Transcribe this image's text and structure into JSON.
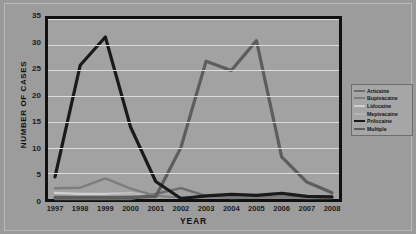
{
  "chart_data": {
    "type": "line",
    "title": "",
    "xlabel": "YEAR",
    "ylabel": "NUMBER OF CASES",
    "categories": [
      "1997",
      "1998",
      "1999",
      "2000",
      "2001",
      "2002",
      "2003",
      "2004",
      "2005",
      "2006",
      "2007",
      "2008"
    ],
    "ylim": [
      0,
      35
    ],
    "yticks": [
      0,
      5,
      10,
      15,
      20,
      25,
      30,
      35
    ],
    "grid": true,
    "legend_position": "right",
    "series": [
      {
        "name": "Articaine",
        "color": "#6b6b6b",
        "values": [
          0,
          0,
          0,
          0,
          1.0,
          2.1,
          0.6,
          0.2,
          0.3,
          0.4,
          0.3,
          0.5
        ]
      },
      {
        "name": "Bupivacaine",
        "color": "#7d7d7d",
        "values": [
          2.1,
          2.2,
          4.0,
          2.0,
          0.6,
          0.3,
          0.3,
          0.3,
          0.3,
          0.3,
          0.2,
          0.2
        ]
      },
      {
        "name": "Lidocaine",
        "color": "#cfcfcf",
        "values": [
          1.2,
          1.0,
          1.0,
          1.1,
          0.6,
          0.3,
          0.3,
          0.3,
          0.4,
          0.3,
          0.3,
          0.3
        ]
      },
      {
        "name": "Mepivacaine",
        "color": "#b4b4b4",
        "values": [
          0.4,
          0.5,
          0.6,
          1.0,
          0.5,
          0.3,
          0.4,
          0.4,
          0.5,
          0.4,
          0.3,
          0.3
        ]
      },
      {
        "name": "Prilocaine",
        "color": "#1a1a1a",
        "values": [
          4.3,
          26.0,
          31.5,
          14.0,
          3.4,
          0.1,
          0.6,
          0.9,
          0.7,
          1.1,
          0.5,
          0.4
        ]
      },
      {
        "name": "Multiple",
        "color": "#5d5d5d",
        "values": [
          0.3,
          0.3,
          0.3,
          0.3,
          0.5,
          10.0,
          26.8,
          25.0,
          30.8,
          8.2,
          3.3,
          1.2
        ]
      }
    ],
    "highlight_series": {
      "name": "Multiple",
      "note": "dark line rising after 2002"
    }
  },
  "axis": {
    "y_title": "NUMBER OF CASES",
    "x_title": "YEAR",
    "y_ticks": [
      "0",
      "5",
      "10",
      "15",
      "20",
      "25",
      "30",
      "35"
    ],
    "x_ticks": [
      "1997",
      "1998",
      "1999",
      "2000",
      "2001",
      "2002",
      "2003",
      "2004",
      "2005",
      "2006",
      "2007",
      "2008"
    ]
  },
  "legend": {
    "items": [
      {
        "label": "Articaine",
        "color": "#6b6b6b"
      },
      {
        "label": "Bupivacaine",
        "color": "#7d7d7d"
      },
      {
        "label": "Lidocaine",
        "color": "#cfcfcf"
      },
      {
        "label": "Mepivacaine",
        "color": "#b4b4b4"
      },
      {
        "label": "Prilocaine",
        "color": "#1a1a1a"
      },
      {
        "label": "Multiple",
        "color": "#5d5d5d"
      }
    ]
  },
  "colors": {
    "background": "#9a9a9a",
    "plot_background": "#a2a2a2",
    "frame": "#111111",
    "gridline": "#dcdcdc",
    "text": "#141414"
  }
}
